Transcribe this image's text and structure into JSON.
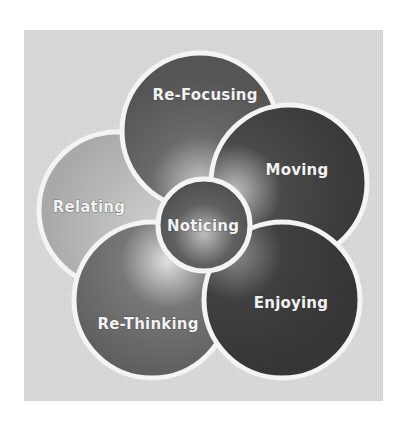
{
  "diagram": {
    "type": "petal-diagram",
    "center": {
      "label": "Noticing"
    },
    "petals": [
      {
        "label": "Re-Focusing",
        "position": "top"
      },
      {
        "label": "Moving",
        "position": "right"
      },
      {
        "label": "Enjoying",
        "position": "bottom-right"
      },
      {
        "label": "Re-Thinking",
        "position": "bottom-left"
      },
      {
        "label": "Relating",
        "position": "left"
      }
    ]
  },
  "colors": {
    "background_box": "#d9d9d9",
    "re_focusing": "#5c5c5c",
    "moving": "#3e3e3e",
    "enjoying": "#3a3a3a",
    "re_thinking": "#6a6a6a",
    "relating": "#b3b3b3",
    "noticing": "#575757",
    "separator": "#f4f4f4"
  }
}
